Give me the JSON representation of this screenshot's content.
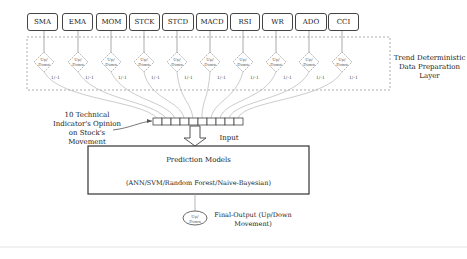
{
  "indicators": [
    "SMA",
    "EMA",
    "MOM",
    "STCK",
    "STCD",
    "MACD",
    "RSI",
    "WR",
    "ADO",
    "CCI"
  ],
  "diamond_label": "Up/ Down",
  "binary_label": "1/-1",
  "layer_label": "Trend Deterministic Data Preparation Layer",
  "opinion_label": "10 Technical Indicator's Opinion on Stock's Movement",
  "input_label": "Input",
  "model_title": "Prediction Models",
  "model_list": "(ANN/SVM/Random Forest/Naive-Bayesian)",
  "output_node": "Up/ Down",
  "final_output": "Final-Output (Up/Down Movement)"
}
